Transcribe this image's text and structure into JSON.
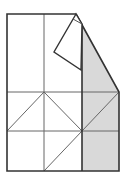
{
  "diagram": {
    "type": "origami-fold-step",
    "colors": {
      "paper": "#ffffff",
      "shaded": "#d9d9d9",
      "outline": "#333333",
      "crease": "#666666"
    }
  }
}
